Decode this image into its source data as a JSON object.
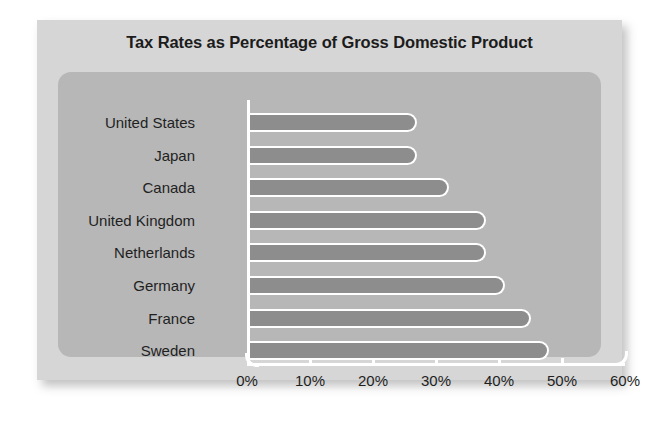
{
  "chart_data": {
    "type": "bar",
    "orientation": "horizontal",
    "title": "Tax Rates as Percentage of Gross Domestic Product",
    "xlabel": "",
    "ylabel": "",
    "categories": [
      "United States",
      "Japan",
      "Canada",
      "United Kingdom",
      "Netherlands",
      "Germany",
      "France",
      "Sweden"
    ],
    "values": [
      27,
      27,
      32,
      38,
      38,
      41,
      45,
      48
    ],
    "xlim": [
      0,
      60
    ],
    "xticks": [
      0,
      10,
      20,
      30,
      40,
      50,
      60
    ],
    "xtick_labels": [
      "0%",
      "10%",
      "20%",
      "30%",
      "40%",
      "50%",
      "60%"
    ],
    "grid": false,
    "legend": null,
    "colors": {
      "bar_fill": "#8d8d8d",
      "bar_outline": "#ffffff",
      "plot_panel": "#b7b7b7",
      "card_background": "#d6d6d6",
      "page_background": "#ffffff",
      "title_text": "#1c1c1c",
      "axis": "#ffffff"
    }
  }
}
